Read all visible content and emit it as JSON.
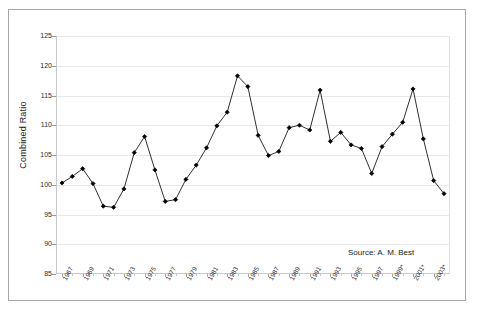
{
  "chart_data": {
    "type": "line",
    "title": "",
    "subtitle": "",
    "xlabel": "",
    "ylabel": "Combined Ratio",
    "ylim": [
      85,
      125
    ],
    "ytick_values": [
      85,
      90,
      95,
      100,
      105,
      110,
      115,
      120,
      125
    ],
    "ytick_labels": [
      "85",
      "90",
      "95",
      "100",
      "105",
      "110",
      "115",
      "120",
      "125"
    ],
    "grid": true,
    "legend": null,
    "annotations": [
      {
        "name": "source-note",
        "text": "Source: A. M. Best"
      }
    ],
    "marker": "diamond",
    "line_color": "#1a1a1a",
    "marker_color": "#000000",
    "x": [
      1967,
      1968,
      1969,
      1970,
      1971,
      1972,
      1973,
      1974,
      1975,
      1976,
      1977,
      1978,
      1979,
      1980,
      1981,
      1982,
      1983,
      1984,
      1985,
      1986,
      1987,
      1988,
      1989,
      1990,
      1991,
      1992,
      1993,
      1994,
      1995,
      1996,
      1997,
      1998,
      1999,
      2000,
      2001,
      2002,
      2003,
      2004
    ],
    "xtick_labels": [
      "1967",
      "1969",
      "1971",
      "1973",
      "1975",
      "1977",
      "1979",
      "1981",
      "1983",
      "1985",
      "1987",
      "1989",
      "1991",
      "1993",
      "1995",
      "1997",
      "1999*",
      "2001*",
      "2003*"
    ],
    "xtick_years": [
      1967,
      1969,
      1971,
      1973,
      1975,
      1977,
      1979,
      1981,
      1983,
      1985,
      1987,
      1989,
      1991,
      1993,
      1995,
      1997,
      1999,
      2001,
      2003
    ],
    "values": [
      100.3,
      101.4,
      102.7,
      100.2,
      96.4,
      96.2,
      99.3,
      105.4,
      108.1,
      102.5,
      97.2,
      97.5,
      100.9,
      103.3,
      106.2,
      109.9,
      112.2,
      118.3,
      116.5,
      108.3,
      104.9,
      105.6,
      109.6,
      110.0,
      109.2,
      115.9,
      107.3,
      108.8,
      106.7,
      106.1,
      101.9,
      106.4,
      108.5,
      110.5,
      116.1,
      107.7,
      100.7,
      98.5
    ],
    "series": [
      {
        "name": "Combined Ratio",
        "values": [
          100.3,
          101.4,
          102.7,
          100.2,
          96.4,
          96.2,
          99.3,
          105.4,
          108.1,
          102.5,
          97.2,
          97.5,
          100.9,
          103.3,
          106.2,
          109.9,
          112.2,
          118.3,
          116.5,
          108.3,
          104.9,
          105.6,
          109.6,
          110.0,
          109.2,
          115.9,
          107.3,
          108.8,
          106.7,
          106.1,
          101.9,
          106.4,
          108.5,
          110.5,
          116.1,
          107.7,
          100.7,
          98.5
        ]
      }
    ]
  }
}
